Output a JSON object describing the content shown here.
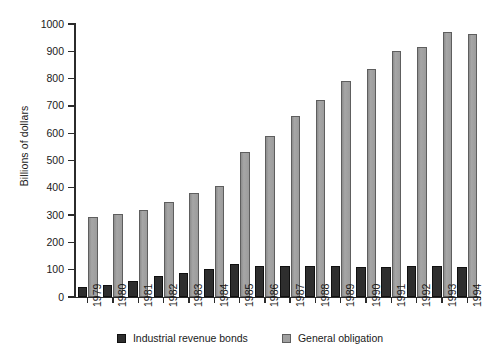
{
  "chart_data": {
    "type": "bar",
    "title": "",
    "subtitle": "",
    "xlabel": "",
    "ylabel": "Billions of dollars",
    "ylim": [
      0,
      1000
    ],
    "ytick_step": 100,
    "yticks": [
      0,
      100,
      200,
      300,
      400,
      500,
      600,
      700,
      800,
      900,
      1000
    ],
    "grid": false,
    "legend_position": "bottom",
    "categories": [
      "1979",
      "1980",
      "1981",
      "1982",
      "1983",
      "1984",
      "1985",
      "1986",
      "1987",
      "1988",
      "1989",
      "1990",
      "1991",
      "1992",
      "1993",
      "1994"
    ],
    "series": [
      {
        "name": "Industrial revenue bonds",
        "color": "#2e2e2e",
        "values": [
          35,
          45,
          60,
          78,
          88,
          104,
          122,
          113,
          113,
          113,
          112,
          111,
          111,
          112,
          112,
          110
        ]
      },
      {
        "name": "General obligation",
        "color": "#a0a0a0",
        "values": [
          293,
          304,
          317,
          347,
          380,
          408,
          533,
          588,
          664,
          721,
          790,
          836,
          900,
          917,
          970,
          962
        ]
      }
    ]
  },
  "axes": {
    "y_title": "Billions of dollars"
  },
  "legend": {
    "items": [
      {
        "label": "Industrial revenue bonds",
        "swatch": "dark-square-swatch"
      },
      {
        "label": "General obligation",
        "swatch": "gray-square-swatch"
      }
    ]
  }
}
